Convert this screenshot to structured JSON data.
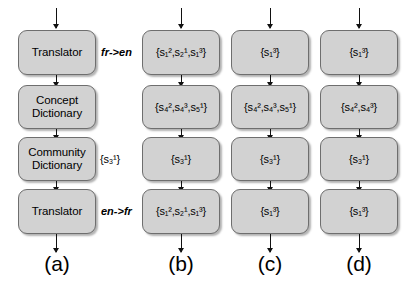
{
  "figure": {
    "type": "flow-diagram",
    "columns": [
      {
        "id": "a",
        "caption": "(a)",
        "cells": [
          {
            "kind": "text",
            "lines": [
              "Translator"
            ]
          },
          {
            "kind": "text",
            "lines": [
              "Concept",
              "Dictionary"
            ]
          },
          {
            "kind": "text",
            "lines": [
              "Community",
              "Dictionary"
            ]
          },
          {
            "kind": "text",
            "lines": [
              "Translator"
            ]
          }
        ]
      },
      {
        "id": "b",
        "caption": "(b)",
        "cells": [
          {
            "kind": "set",
            "text": "{s₁²,s₂¹,s₁³}"
          },
          {
            "kind": "set",
            "text": "{s₄²,s₄³,s₅¹}"
          },
          {
            "kind": "set",
            "text": "{s₃¹}"
          },
          {
            "kind": "set",
            "text": "{s₁²,s₂¹,s₁³}"
          }
        ]
      },
      {
        "id": "c",
        "caption": "(c)",
        "cells": [
          {
            "kind": "set",
            "text": "{s₁³}"
          },
          {
            "kind": "set",
            "text": "{s₄²,s₄³,s₅¹}"
          },
          {
            "kind": "set",
            "text": "{s₃¹}"
          },
          {
            "kind": "set",
            "text": "{s₁³}"
          }
        ]
      },
      {
        "id": "d",
        "caption": "(d)",
        "cells": [
          {
            "kind": "set",
            "text": "{s₁³}"
          },
          {
            "kind": "set",
            "text": "{s₄²,s₄³}"
          },
          {
            "kind": "set",
            "text": "{s₃¹}"
          },
          {
            "kind": "set",
            "text": "{s₁³}"
          }
        ]
      }
    ],
    "annotations": {
      "translate_fr_en": "fr->en",
      "translate_en_fr": "en->fr",
      "community_set": "{s₃¹}"
    },
    "colors": {
      "node_fill": "#d2d2d2",
      "node_border": "#6e6e6e",
      "arrow": "#111111",
      "text": "#000000",
      "background": "#ffffff"
    }
  }
}
